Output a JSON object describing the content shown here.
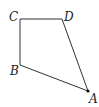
{
  "diagram": {
    "type": "quadrilateral",
    "vertices": [
      {
        "name": "A",
        "x": 88,
        "y": 91,
        "label_x": 89,
        "label_y": 103,
        "dot": true
      },
      {
        "name": "B",
        "x": 20,
        "y": 65,
        "label_x": 10,
        "label_y": 75,
        "dot": false
      },
      {
        "name": "C",
        "x": 20,
        "y": 19,
        "label_x": 9,
        "label_y": 21,
        "dot": false
      },
      {
        "name": "D",
        "x": 62,
        "y": 19,
        "label_x": 64,
        "label_y": 21,
        "dot": false
      }
    ],
    "edges": [
      [
        "C",
        "D"
      ],
      [
        "D",
        "A"
      ],
      [
        "A",
        "B"
      ],
      [
        "B",
        "C"
      ]
    ],
    "colors": {
      "stroke": "#333333",
      "label": "#222222"
    }
  }
}
